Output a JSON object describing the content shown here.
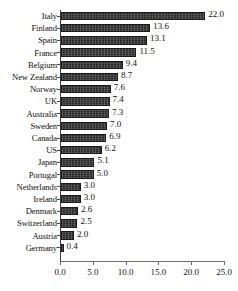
{
  "chart_data": {
    "type": "bar",
    "orientation": "horizontal",
    "title": "",
    "subtitle": "",
    "xlabel": "",
    "ylabel": "",
    "xlim": [
      0.0,
      25.0
    ],
    "xticks": [
      "0.0",
      "5.0",
      "10.0",
      "15.0",
      "20.0",
      "25.0"
    ],
    "xtick_values": [
      0.0,
      5.0,
      10.0,
      15.0,
      20.0,
      25.0
    ],
    "grid": false,
    "legend": null,
    "bar_color": "#2b2b2b",
    "background": "#ffffff",
    "categories": [
      "Italy",
      "Finland",
      "Spain",
      "France",
      "Belgium",
      "New Zealand",
      "Norway",
      "UK",
      "Australia",
      "Sweden",
      "Canada",
      "US",
      "Japan",
      "Portugal",
      "Netherlands",
      "Ireland",
      "Denmark",
      "Switzerland",
      "Austria",
      "Germany"
    ],
    "values": [
      22.0,
      13.6,
      13.1,
      11.5,
      9.4,
      8.7,
      7.6,
      7.4,
      7.3,
      7.0,
      6.9,
      6.2,
      5.1,
      5.0,
      3.0,
      3.0,
      2.6,
      2.5,
      2.0,
      0.4
    ],
    "value_labels": [
      "22.0",
      "13.6",
      "13.1",
      "11.5",
      "9.4",
      "8.7",
      "7.6",
      "7.4",
      "7.3",
      "7.0",
      "6.9",
      "6.2",
      "5.1",
      "5.0",
      "3.0",
      "3.0",
      "2.6",
      "2.5",
      "2.0",
      "0.4"
    ]
  }
}
